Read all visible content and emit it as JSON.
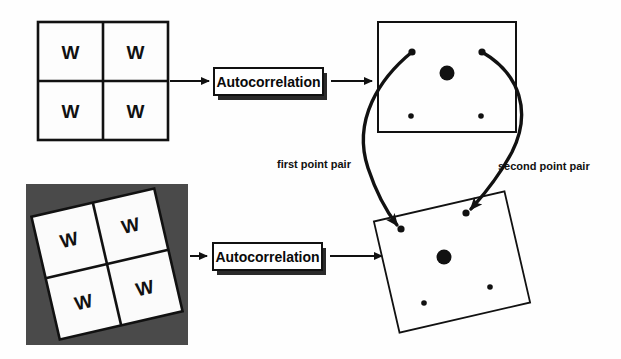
{
  "figure": {
    "background_color": "#fefefe",
    "stroke_color": "#111111",
    "dark_patch_color": "#4a4a4a",
    "tile_fill": "#fbfbfb"
  },
  "top_row": {
    "grid": {
      "name": "upright-w-grid",
      "rotation_deg": 0,
      "cells": [
        {
          "label": "W"
        },
        {
          "label": "W"
        },
        {
          "label": "W"
        },
        {
          "label": "W"
        }
      ]
    },
    "process_box": {
      "label": "Autocorrelation"
    },
    "result_panel": {
      "rotation_deg": 0,
      "points": [
        {
          "id": "center",
          "size": "large",
          "cx": 447,
          "cy": 73
        },
        {
          "id": "upper-left",
          "size": "medium",
          "cx": 412,
          "cy": 52
        },
        {
          "id": "upper-right",
          "size": "medium",
          "cx": 482,
          "cy": 52
        },
        {
          "id": "lower-left",
          "size": "small",
          "cx": 411,
          "cy": 116
        },
        {
          "id": "lower-right",
          "size": "small",
          "cx": 481,
          "cy": 116
        }
      ]
    }
  },
  "bottom_row": {
    "grid": {
      "name": "rotated-w-grid",
      "rotation_deg": -13,
      "cells": [
        {
          "label": "W"
        },
        {
          "label": "W"
        },
        {
          "label": "W"
        },
        {
          "label": "W"
        }
      ]
    },
    "process_box": {
      "label": "Autocorrelation"
    },
    "result_panel": {
      "rotation_deg": -13,
      "points": [
        {
          "id": "center",
          "size": "large",
          "cx": 444,
          "cy": 257
        },
        {
          "id": "upper-left",
          "size": "medium",
          "cx": 401,
          "cy": 229
        },
        {
          "id": "upper-right",
          "size": "medium",
          "cx": 466,
          "cy": 213
        },
        {
          "id": "lower-left",
          "size": "small",
          "cx": 424,
          "cy": 303
        },
        {
          "id": "lower-right",
          "size": "small",
          "cx": 490,
          "cy": 287
        }
      ]
    }
  },
  "correspondences": [
    {
      "label": "first point pair"
    },
    {
      "label": "second point pair"
    }
  ]
}
